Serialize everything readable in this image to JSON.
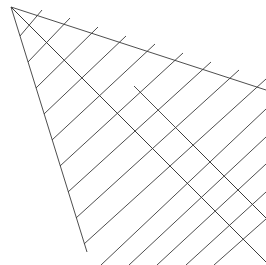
{
  "figure": {
    "title": "",
    "type": "line-drawing",
    "width": 266,
    "height": 265,
    "background_color": "#ffffff",
    "stroke_color": "#3a3a3a",
    "stroke_width": 0.9,
    "apex": {
      "x": 11,
      "y": 7
    },
    "left_vertex": {
      "x": 87,
      "y": 252
    },
    "top_edge_exit": {
      "x": 266,
      "y": 90
    },
    "edges": [
      {
        "name": "left-edge",
        "x1": 11,
        "y1": 7,
        "x2": 87,
        "y2": 252
      },
      {
        "name": "top-edge",
        "x1": 11,
        "y1": 7,
        "x2": 266,
        "y2": 90
      },
      {
        "name": "apex-diagonal",
        "x1": 11,
        "y1": 7,
        "x2": 266,
        "y2": 262
      }
    ],
    "hatch": {
      "name": "primary-hatch",
      "direction": "slash",
      "count": 14,
      "angle_deg": -42,
      "spacing_px": 17.8,
      "lines": [
        {
          "x1": 20,
          "y1": 36,
          "x2": 42,
          "y2": 10
        },
        {
          "x1": 28,
          "y1": 62,
          "x2": 70,
          "y2": 18
        },
        {
          "x1": 36,
          "y1": 88,
          "x2": 98,
          "y2": 27
        },
        {
          "x1": 44,
          "y1": 114,
          "x2": 126,
          "y2": 36
        },
        {
          "x1": 52,
          "y1": 140,
          "x2": 155,
          "y2": 44
        },
        {
          "x1": 60,
          "y1": 166,
          "x2": 183,
          "y2": 53
        },
        {
          "x1": 68,
          "y1": 192,
          "x2": 211,
          "y2": 62
        },
        {
          "x1": 76,
          "y1": 218,
          "x2": 239,
          "y2": 70
        },
        {
          "x1": 84,
          "y1": 244,
          "x2": 266,
          "y2": 79
        },
        {
          "x1": 101,
          "y1": 265,
          "x2": 266,
          "y2": 109
        },
        {
          "x1": 129,
          "y1": 265,
          "x2": 266,
          "y2": 137
        },
        {
          "x1": 157,
          "y1": 265,
          "x2": 266,
          "y2": 164
        },
        {
          "x1": 186,
          "y1": 265,
          "x2": 266,
          "y2": 192
        },
        {
          "x1": 214,
          "y1": 265,
          "x2": 266,
          "y2": 219
        }
      ]
    },
    "cross_hatch": {
      "name": "secondary-hatch",
      "direction": "backslash",
      "count": 4,
      "angle_deg": 45,
      "spacing_px": 44,
      "lines": [
        {
          "x1": 11,
          "y1": 7,
          "x2": 266,
          "y2": 262
        },
        {
          "x1": 134,
          "y1": 86,
          "x2": 266,
          "y2": 218
        },
        {
          "x1": 178,
          "y1": 130,
          "x2": 266,
          "y2": 218
        },
        {
          "x1": 222,
          "y1": 174,
          "x2": 266,
          "y2": 218
        }
      ]
    }
  }
}
